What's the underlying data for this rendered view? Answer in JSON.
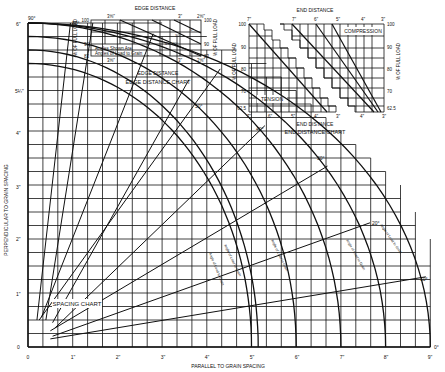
{
  "chart_data": [
    {
      "id": "spacing-chart",
      "type": "line",
      "title": "SPACING CHART",
      "xlabel": "PARALLEL TO GRAIN SPACING",
      "ylabel": "PERPENDICULAR TO GRAIN SPACING",
      "x_ticks": [
        "0",
        "1\"",
        "2\"",
        "3\"",
        "4\"",
        "5\"",
        "6\"",
        "7\"",
        "8\"",
        "9\""
      ],
      "y_ticks": [
        "0",
        "1\"",
        "2\"",
        "3\"",
        "4\"",
        "5¼\"",
        "6\""
      ],
      "xlim": [
        0,
        9
      ],
      "ylim": [
        0,
        6
      ],
      "grid": true,
      "angle_rays": [
        "90°",
        "80°",
        "50°",
        "40°",
        "30°",
        "20°",
        "10°",
        "0°"
      ],
      "curve_labels": [
        "Angle of Load to Grain 90°",
        "Angle of Load to Grain 60°",
        "Angle of Load to Grain 45°",
        "Angle of Load to Grain 30°",
        "Angle of Load to Grain 0°"
      ],
      "curve_x_intercepts": [
        5,
        5,
        7,
        8,
        9
      ],
      "curve_y_intercepts": [
        5.25,
        5.25,
        6,
        6,
        6
      ]
    },
    {
      "id": "edge-distance-chart",
      "type": "line",
      "title": "EDGE DISTANCE CHART",
      "xlabel": "EDGE DISTANCE",
      "ylabel": "% OF FULL LOAD",
      "x_ticks": [
        "3⅝\"",
        "3\"",
        "2⅝\""
      ],
      "y_ticks": [
        "83",
        "90",
        "100"
      ],
      "ylim": [
        83,
        100
      ],
      "note": "Angles Shown Are Angles of Load to Grain",
      "series": [
        {
          "name": "0°",
          "values": [
            [
              3.0,
              100
            ],
            [
              2.625,
              96
            ]
          ]
        },
        {
          "name": "30°",
          "values": [
            [
              3.3,
              100
            ],
            [
              2.625,
              91
            ]
          ]
        },
        {
          "name": "45°-90°",
          "values": [
            [
              3.625,
              100
            ],
            [
              2.625,
              83
            ]
          ]
        }
      ]
    },
    {
      "id": "end-distance-chart",
      "type": "line",
      "title": "END DISTANCE CHART",
      "xlabel": "END DISTANCE",
      "ylabel": "% OF FULL LOAD",
      "tension_x_ticks": [
        "7\"",
        "6\"",
        "5\"",
        "4\"",
        "3\""
      ],
      "compression_x_ticks": [
        "7\"",
        "6\"",
        "5\"",
        "4\"",
        "3\""
      ],
      "y_ticks": [
        "62.5",
        "70",
        "80",
        "90",
        "100"
      ],
      "ylim": [
        62.5,
        100
      ],
      "regions": [
        "TENSION",
        "COMPRESSION"
      ],
      "series": [
        {
          "name": "Tension",
          "values": [
            [
              7,
              100
            ],
            [
              3.5,
              62.5
            ]
          ]
        },
        {
          "name": "Compression 90°",
          "values": [
            [
              7,
              100
            ],
            [
              3.5,
              62.5
            ]
          ]
        },
        {
          "name": "Compression 45°",
          "values": [
            [
              6,
              100
            ],
            [
              3.25,
              62.5
            ]
          ]
        },
        {
          "name": "Compression 0°",
          "values": [
            [
              5,
              100
            ],
            [
              3.1,
              62.5
            ]
          ]
        }
      ]
    }
  ],
  "labels": {
    "edge_top": "EDGE DISTANCE",
    "edge_bottom": "EDGE DISTANCE",
    "edge_title": "EDGE DISTANCE CHART",
    "edge_ylabel": "% OF FULL LOAD",
    "edge_note1": "Angles Shown Are",
    "edge_note2": "Angles of Load to Grain",
    "edge_x0": "3⅝\"",
    "edge_x1": "3\"",
    "edge_x2": "2⅝\"",
    "edge_y100": "100",
    "edge_y90": "90",
    "edge_y83": "83",
    "edge_l0": "0°",
    "edge_l30": "30°",
    "edge_l45": "45°-90°",
    "end_top": "END DISTANCE",
    "end_bottom": "END DISTANCE",
    "end_title": "END DISTANCE CHART",
    "end_ylabel": "% OF FULL LOAD",
    "tension": "TENSION",
    "compression": "COMPRESSION",
    "end_y100": "100",
    "end_y90": "90",
    "end_y80": "80",
    "end_y70": "70",
    "end_y625": "62.5",
    "end_x7": "7\"",
    "end_x6": "6\"",
    "end_x5": "5\"",
    "end_x4": "4\"",
    "end_x3": "3\"",
    "spacing_title": "SPACING CHART",
    "xlabel": "PARALLEL TO GRAIN SPACING",
    "ylabel": "PERPENDICULAR TO GRAIN SPACING",
    "x0": "0",
    "x1": "1\"",
    "x2": "2\"",
    "x3": "3\"",
    "x4": "4\"",
    "x5": "5\"",
    "x6": "6\"",
    "x7": "7\"",
    "x8": "8\"",
    "x9": "9\"",
    "y0": "0",
    "y1": "1\"",
    "y2": "2\"",
    "y3": "3\"",
    "y4": "4\"",
    "y5": "5¼\"",
    "y6": "6\"",
    "a90": "90°",
    "a80": "80°",
    "a50": "50°",
    "a40": "40°",
    "a30": "30°",
    "a20": "20°",
    "a10": "10°",
    "a0": "0°",
    "curve_label": "Angle of Load to Grain"
  }
}
